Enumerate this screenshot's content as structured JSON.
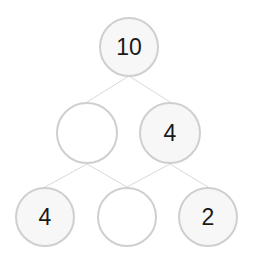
{
  "diagram": {
    "type": "number-bond-pyramid",
    "line_color": "#d9d9d9",
    "border_color": "#cfcfcf",
    "nodes": [
      {
        "id": "top",
        "label": "10",
        "cx": 129,
        "cy": 47,
        "r": 30
      },
      {
        "id": "mid_left",
        "label": "",
        "cx": 87,
        "cy": 133,
        "r": 31
      },
      {
        "id": "mid_right",
        "label": "4",
        "cx": 170,
        "cy": 133,
        "r": 31
      },
      {
        "id": "bottom_left",
        "label": "4",
        "cx": 45,
        "cy": 217,
        "r": 30
      },
      {
        "id": "bottom_middle",
        "label": "",
        "cx": 127,
        "cy": 217,
        "r": 30
      },
      {
        "id": "bottom_right",
        "label": "2",
        "cx": 208,
        "cy": 217,
        "r": 30
      }
    ],
    "edges": [
      {
        "from": "top",
        "to": "mid_left"
      },
      {
        "from": "top",
        "to": "mid_right"
      },
      {
        "from": "mid_left",
        "to": "bottom_left"
      },
      {
        "from": "mid_left",
        "to": "bottom_middle"
      },
      {
        "from": "mid_right",
        "to": "bottom_middle"
      },
      {
        "from": "mid_right",
        "to": "bottom_right"
      }
    ]
  }
}
